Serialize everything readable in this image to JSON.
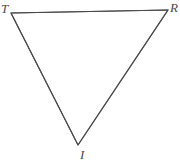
{
  "figure": {
    "type": "geometry-diagram",
    "shape": "triangle",
    "orientation": "inverted",
    "name": "Triangle TRI",
    "background_color": "#ffffff",
    "stroke_color": "#4a4a4a",
    "label_color": "#4a4a4a",
    "stroke_width": 1.1,
    "canvas": {
      "width": 180,
      "height": 163
    }
  },
  "vertices": [
    {
      "id": "T",
      "label": "T",
      "x": 11,
      "y": 13,
      "label_x": 1,
      "label_y": 2,
      "position": "top-left"
    },
    {
      "id": "R",
      "label": "R",
      "x": 168,
      "y": 10,
      "label_x": 170,
      "label_y": 1,
      "position": "top-right",
      "clipped": true
    },
    {
      "id": "I",
      "label": "I",
      "x": 78,
      "y": 145,
      "label_x": 80,
      "label_y": 148,
      "position": "bottom"
    }
  ],
  "edges": [
    {
      "id": "TR",
      "from": "T",
      "to": "R",
      "name": "top-edge"
    },
    {
      "id": "RI",
      "from": "R",
      "to": "I",
      "name": "right-edge"
    },
    {
      "id": "IT",
      "from": "I",
      "to": "T",
      "name": "left-edge"
    }
  ],
  "polygon_points": "11,13 168,10 78,145"
}
